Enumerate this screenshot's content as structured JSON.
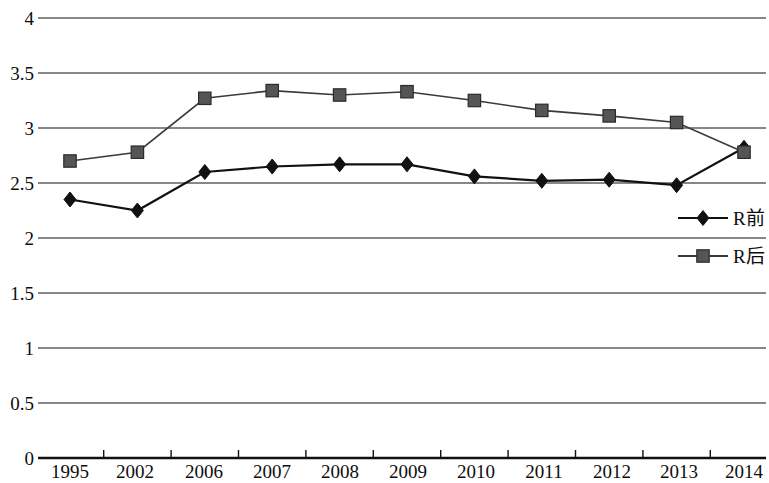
{
  "chart_data": {
    "type": "line",
    "title": "",
    "subtitle": "",
    "xlabel": "",
    "ylabel": "",
    "categories": [
      "1995",
      "2002",
      "2006",
      "2007",
      "2008",
      "2009",
      "2010",
      "2011",
      "2012",
      "2013",
      "2014"
    ],
    "series": [
      {
        "name": "R前",
        "marker": "diamond",
        "color": "#111111",
        "values": [
          2.35,
          2.25,
          2.6,
          2.65,
          2.67,
          2.67,
          2.56,
          2.52,
          2.53,
          2.48,
          2.82
        ]
      },
      {
        "name": "R后",
        "marker": "square",
        "color": "#555555",
        "values": [
          2.7,
          2.78,
          3.27,
          3.34,
          3.3,
          3.33,
          3.25,
          3.16,
          3.11,
          3.05,
          2.78
        ]
      }
    ],
    "ylim": [
      0,
      4
    ],
    "ytick_labels": [
      "0",
      "0.5",
      "1",
      "1.5",
      "2",
      "2.5",
      "3",
      "3.5",
      "4"
    ],
    "ytick_values": [
      0,
      0.5,
      1,
      1.5,
      2,
      2.5,
      3,
      3.5,
      4
    ],
    "grid": true,
    "grid_axis": "y",
    "legend_position": "right-middle",
    "legend_entries": [
      {
        "label": "R前",
        "marker": "diamond"
      },
      {
        "label": "R后",
        "marker": "square"
      }
    ]
  }
}
